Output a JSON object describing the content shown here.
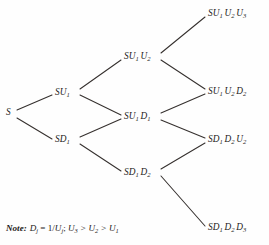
{
  "diagram": {
    "type": "recombining-binomial-lattice",
    "title": "",
    "background_color": "#fefefe",
    "line_color": "#35302e",
    "text_color": "#1d1a19",
    "nodes": [
      {
        "id": "root",
        "label": "S",
        "base": "S",
        "subs": [],
        "step": 0,
        "x": 8,
        "y": 113
      },
      {
        "id": "u1",
        "label": "SU1",
        "base": "S",
        "subs": [
          "U1"
        ],
        "step": 1,
        "x": 55,
        "y": 93
      },
      {
        "id": "d1",
        "label": "SD1",
        "base": "S",
        "subs": [
          "D1"
        ],
        "step": 1,
        "x": 55,
        "y": 141
      },
      {
        "id": "u1u2",
        "label": "SU1 U2",
        "base": "S",
        "subs": [
          "U1",
          "U2"
        ],
        "step": 2,
        "x": 124,
        "y": 57
      },
      {
        "id": "u1d1",
        "label": "SU1 D1",
        "base": "S",
        "subs": [
          "U1",
          "D1"
        ],
        "step": 2,
        "x": 124,
        "y": 117
      },
      {
        "id": "d1d2",
        "label": "SD1 D2",
        "base": "S",
        "subs": [
          "D1",
          "D2"
        ],
        "step": 2,
        "x": 124,
        "y": 173
      },
      {
        "id": "u1u2u3",
        "label": "SU1 U2 U3",
        "base": "S",
        "subs": [
          "U1",
          "U2",
          "U3"
        ],
        "step": 3,
        "x": 208,
        "y": 14
      },
      {
        "id": "u1u2d2",
        "label": "SU1 U2 D2",
        "base": "S",
        "subs": [
          "U1",
          "U2",
          "D2"
        ],
        "step": 3,
        "x": 208,
        "y": 92
      },
      {
        "id": "d1d2u2",
        "label": "SD1 D2 U2",
        "base": "S",
        "subs": [
          "D1",
          "D2",
          "U2"
        ],
        "step": 3,
        "x": 208,
        "y": 140
      },
      {
        "id": "d1d2d3",
        "label": "SD1 D2 D3",
        "base": "S",
        "subs": [
          "D1",
          "D2",
          "D3"
        ],
        "step": 3,
        "x": 208,
        "y": 228
      }
    ],
    "edges": [
      {
        "from": "root",
        "to": "u1",
        "direction": "up"
      },
      {
        "from": "root",
        "to": "d1",
        "direction": "down"
      },
      {
        "from": "u1",
        "to": "u1u2",
        "direction": "up"
      },
      {
        "from": "u1",
        "to": "u1d1",
        "direction": "down"
      },
      {
        "from": "d1",
        "to": "u1d1",
        "direction": "up"
      },
      {
        "from": "d1",
        "to": "d1d2",
        "direction": "down"
      },
      {
        "from": "u1u2",
        "to": "u1u2u3",
        "direction": "up"
      },
      {
        "from": "u1u2",
        "to": "u1u2d2",
        "direction": "down"
      },
      {
        "from": "u1d1",
        "to": "u1u2d2",
        "direction": "up"
      },
      {
        "from": "u1d1",
        "to": "d1d2u2",
        "direction": "down"
      },
      {
        "from": "d1d2",
        "to": "d1d2u2",
        "direction": "up"
      },
      {
        "from": "d1d2",
        "to": "d1d2d3",
        "direction": "down"
      }
    ]
  },
  "note": {
    "prefix": "Note:",
    "definition_var": "D",
    "definition_var_sub": "j",
    "equals": "=",
    "definition_value_numerator": "1/",
    "definition_value_var": "U",
    "definition_value_sub": "j",
    "separator": ";",
    "inequality": {
      "terms": [
        "U3",
        "U2",
        "U1"
      ],
      "operator": ">",
      "text": "U3 > U2 > U1"
    },
    "full_text": "Note: Dj = 1/Uj; U3 > U2 > U1"
  }
}
